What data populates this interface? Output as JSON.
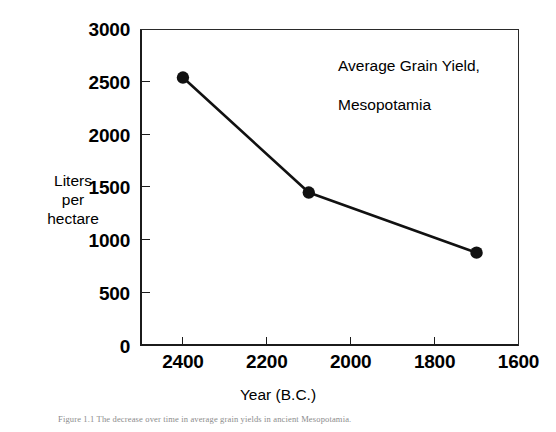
{
  "figure": {
    "background_color": "#ffffff",
    "ink_color": "#1b1b1b",
    "caption": "Figure 1.1  The decrease over time in average grain yields in ancient Mesopotamia."
  },
  "chart_data": {
    "type": "line",
    "title": "Average Grain Yield,\nMesopotamia",
    "title_line1": "Average Grain Yield,",
    "title_line2": "Mesopotamia",
    "xlabel": "Year (B.C.)",
    "ylabel": "Liters\nper\nhectare",
    "ylabel_line1": "Liters",
    "ylabel_line2": "per",
    "ylabel_line3": "hectare",
    "x": [
      2400,
      2100,
      1700
    ],
    "values": [
      2540,
      1450,
      880
    ],
    "points": [
      {
        "x": 2400,
        "y": 2540
      },
      {
        "x": 2100,
        "y": 1450
      },
      {
        "x": 1700,
        "y": 880
      }
    ],
    "xlim": [
      2500,
      1600
    ],
    "ylim": [
      0,
      3000
    ],
    "x_reversed": true,
    "xticks": [
      2400,
      2200,
      2000,
      1800,
      1600
    ],
    "xtick_labels": [
      "2400",
      "2200",
      "2000",
      "1800",
      "1600"
    ],
    "yticks": [
      0,
      500,
      1000,
      1500,
      2000,
      2500,
      3000
    ],
    "ytick_labels": [
      "0",
      "500",
      "1000",
      "1500",
      "2000",
      "2500",
      "3000"
    ],
    "grid": false,
    "legend": false,
    "marker": "filled-circle",
    "marker_color": "#111111",
    "line_color": "#111111",
    "line_width": 2.6
  }
}
